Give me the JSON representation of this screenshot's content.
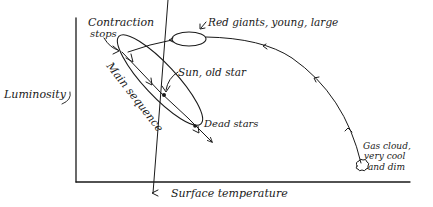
{
  "diagram": {
    "axes": {
      "y_label": "Luminosity",
      "x_label": "Surface temperature",
      "x_arrow": "←"
    },
    "labels": {
      "contraction_line1": "Contraction",
      "contraction_line2": "stops",
      "red_giants": "Red giants, young, large",
      "sun": "Sun, old star",
      "main_sequence": "Main sequence",
      "dead_stars": "Dead stars",
      "gas_cloud_line1": "Gas cloud,",
      "gas_cloud_line2": "very cool",
      "gas_cloud_line3": "and dim"
    },
    "icons": {
      "gas_cloud": "cloud-icon"
    },
    "ink_color": "#1a1a1a"
  }
}
